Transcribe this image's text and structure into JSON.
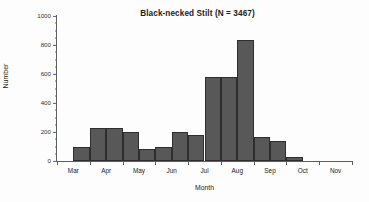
{
  "chart_data": {
    "type": "bar",
    "title": "Black-necked Stilt (N = 3467)",
    "xlabel": "Month",
    "ylabel": "Number",
    "ylim": [
      0,
      1000
    ],
    "ytick_labels": [
      "0",
      "200",
      "400",
      "600",
      "800",
      "1000"
    ],
    "ytick_values": [
      0,
      200,
      400,
      600,
      800,
      1000
    ],
    "yminor_interval": 50,
    "grid": false,
    "legend": null,
    "xtick_labels": [
      "Mar",
      "Apr",
      "May",
      "Jun",
      "Jul",
      "Aug",
      "Sep",
      "Oct",
      "Nov"
    ],
    "bin_width_months": 0.5,
    "categories": [
      "Mar 1-15",
      "Mar 16-31",
      "Apr 1-15",
      "Apr 16-30",
      "May 1-15",
      "May 16-31",
      "Jun 1-15",
      "Jun 16-30",
      "Jul 1-15",
      "Jul 16-31",
      "Aug 1-15",
      "Aug 16-31",
      "Sep 1-15",
      "Sep 16-30",
      "Oct 1-15",
      "Oct 16-31",
      "Nov 1-15",
      "Nov 16-30"
    ],
    "values": [
      0,
      95,
      225,
      228,
      200,
      85,
      100,
      203,
      178,
      578,
      580,
      835,
      165,
      135,
      25,
      0,
      0,
      0
    ],
    "bar_color": "#585858",
    "bar_edge_color": "#2e2e2e",
    "axis_color": "#5e5e5e"
  },
  "chart": {
    "title": "Black-necked Stilt (N = 3467)",
    "y_axis_title": "Number",
    "x_axis_title": "Month"
  }
}
